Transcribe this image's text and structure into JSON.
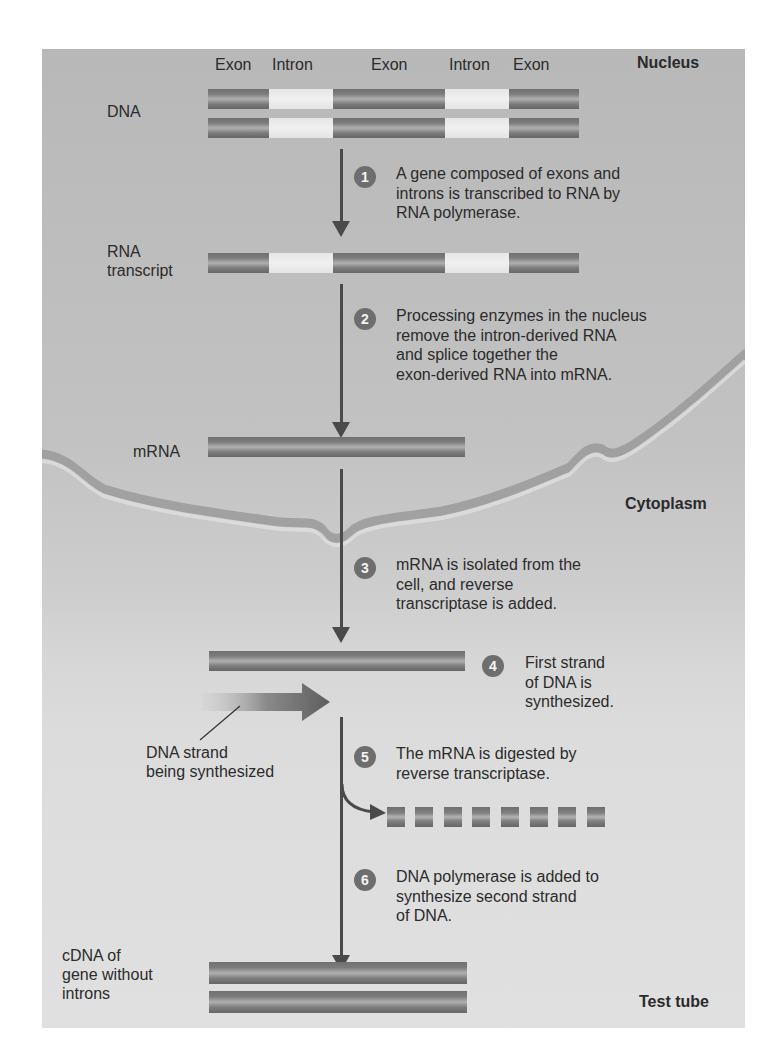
{
  "regions": {
    "nucleus": "Nucleus",
    "cytoplasm": "Cytoplasm",
    "test_tube": "Test tube"
  },
  "gene_segments": [
    "Exon",
    "Intron",
    "Exon",
    "Intron",
    "Exon"
  ],
  "labels": {
    "dna": "DNA",
    "rna_transcript_line1": "RNA",
    "rna_transcript_line2": "transcript",
    "mrna": "mRNA",
    "dna_strand_line1": "DNA strand",
    "dna_strand_line2": "being synthesized",
    "cdna_line1": "cDNA of",
    "cdna_line2": "gene without",
    "cdna_line3": "introns"
  },
  "steps": [
    {
      "number": "1",
      "lines": [
        "A gene composed of exons and",
        "introns is transcribed to RNA by",
        "RNA polymerase."
      ]
    },
    {
      "number": "2",
      "lines": [
        "Processing enzymes in the nucleus",
        "remove the intron-derived RNA",
        "and splice together the",
        "exon-derived RNA into mRNA."
      ]
    },
    {
      "number": "3",
      "lines": [
        "mRNA is isolated from the",
        "cell, and reverse",
        "transcriptase is added."
      ]
    },
    {
      "number": "4",
      "lines": [
        "First strand",
        "of DNA is",
        "synthesized."
      ]
    },
    {
      "number": "5",
      "lines": [
        "The mRNA is digested by",
        "reverse transcriptase."
      ]
    },
    {
      "number": "6",
      "lines": [
        "DNA polymerase is added to",
        "synthesize second strand",
        "of DNA."
      ]
    }
  ],
  "mrna_fragment_count": 8,
  "colors": {
    "exon": "#7a7a7a",
    "intron": "#ececec",
    "arrow": "#4a4a4a",
    "badge": "#6e6e6e",
    "membrane": "#a0a0a0"
  }
}
